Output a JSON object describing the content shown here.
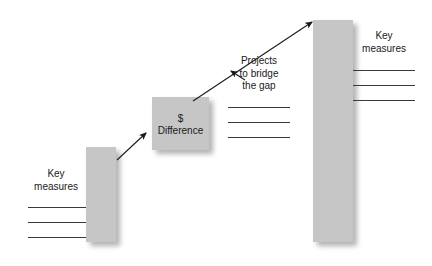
{
  "diagram": {
    "type": "bridge-gap-step-diagram",
    "background_color": "#ffffff",
    "block_color": "#c6c6c6",
    "line_color": "#3a3a3a",
    "text_color": "#1a1a1a",
    "blocks": [
      {
        "id": "current-state-bar",
        "name": "left-bar",
        "x": 86,
        "y": 147,
        "width": 30,
        "height": 95
      },
      {
        "id": "difference-box",
        "name": "middle-box",
        "x": 152,
        "y": 97,
        "width": 57,
        "height": 53
      },
      {
        "id": "target-state-bar",
        "name": "right-bar",
        "x": 313,
        "y": 20,
        "width": 40,
        "height": 222
      }
    ],
    "labels": {
      "left_heading": "Key\nmeasures",
      "middle_box_line1": "$",
      "middle_box_line2": "Difference",
      "middle_heading": "Projects\nto bridge\nthe gap",
      "right_heading": "Key\nmeasures"
    },
    "rule_groups": [
      {
        "name": "left-rules",
        "count": 3,
        "x": 28,
        "width": 58,
        "ys": [
          207,
          222,
          237
        ]
      },
      {
        "name": "middle-rules",
        "count": 3,
        "x": 228,
        "width": 62,
        "ys": [
          107,
          122,
          137
        ]
      },
      {
        "name": "right-rules",
        "count": 3,
        "x": 353,
        "width": 62,
        "ys": [
          70,
          85,
          100
        ]
      }
    ],
    "arrows": [
      {
        "name": "left-bar-to-difference-arrow",
        "from": [
          117,
          160
        ],
        "to": [
          146,
          133
        ]
      },
      {
        "name": "difference-to-target-arrow",
        "from": [
          193,
          101
        ],
        "to": [
          312,
          22
        ]
      },
      {
        "name": "projects-callout-arrowhead",
        "from": [
          245,
          80
        ],
        "to": [
          231,
          71
        ]
      }
    ]
  }
}
